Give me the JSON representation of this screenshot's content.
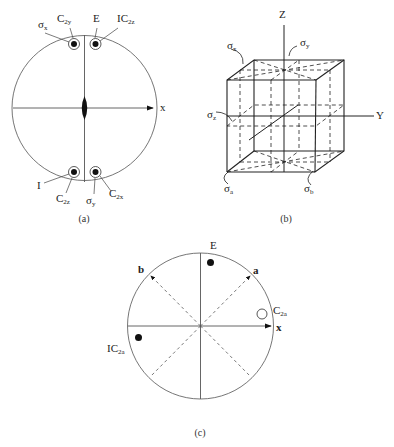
{
  "panel_a": {
    "caption": "(a)",
    "axis_label": "x",
    "labels": {
      "sigma_x": "σ",
      "sigma_x_sub": "x",
      "c2y": "C",
      "c2y_sub": "2y",
      "e": "E",
      "ic2z": "IC",
      "ic2z_sub": "2z",
      "i": "I",
      "c2z": "C",
      "c2z_sub": "2z",
      "sigma_y": "σ",
      "sigma_y_sub": "y",
      "c2x": "C",
      "c2x_sub": "2x"
    }
  },
  "panel_b": {
    "caption": "(b)",
    "axis_z": "Z",
    "axis_y": "Y",
    "labels": {
      "sigma_x": "σ",
      "sigma_x_sub": "x",
      "sigma_y": "σ",
      "sigma_y_sub": "y",
      "sigma_z": "σ",
      "sigma_z_sub": "z",
      "sigma_a": "σ",
      "sigma_a_sub": "a",
      "sigma_b": "σ",
      "sigma_b_sub": "b"
    }
  },
  "panel_c": {
    "caption": "(c)",
    "axis_label": "x",
    "labels": {
      "e": "E",
      "a": "a",
      "b": "b",
      "c2a": "C",
      "c2a_sub": "2a",
      "ic2a": "IC",
      "ic2a_sub": "2a"
    }
  },
  "colors": {
    "line": "#555555",
    "ink": "#111111"
  }
}
